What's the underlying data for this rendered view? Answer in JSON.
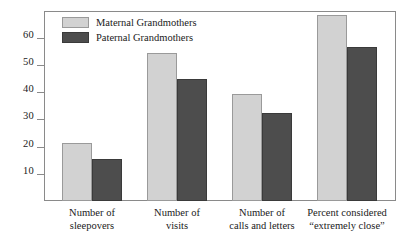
{
  "chart_data": {
    "type": "bar",
    "title": "",
    "subtitle": "",
    "xlabel": "",
    "ylabel": "",
    "grid": false,
    "legend_position": "top-left-inside",
    "ylim": [
      0,
      72
    ],
    "yticks": [
      10,
      20,
      30,
      40,
      50,
      60
    ],
    "ytick_labels": [
      "10",
      "20",
      "30",
      "40",
      "50",
      "60"
    ],
    "categories": [
      "Number of sleepovers",
      "Number of visits",
      "Number of calls and letters",
      "Percent considered \"extremely close\""
    ],
    "category_lines": [
      [
        "Number of",
        "sleepovers"
      ],
      [
        "Number of",
        "visits"
      ],
      [
        "Number of",
        "calls and letters"
      ],
      [
        "Percent considered",
        "“extremely close”"
      ]
    ],
    "series": [
      {
        "name": "Maternal Grandmothers",
        "color": "#d2d2d2",
        "values": [
          21.5,
          54.5,
          39.3,
          68.5
        ]
      },
      {
        "name": "Paternal Grandmothers",
        "color": "#4d4d4d",
        "values": [
          15.6,
          44.8,
          32.4,
          56.5
        ]
      }
    ]
  },
  "legend": {
    "items": [
      {
        "label": "Maternal Grandmothers",
        "swatch": "maternal-swatch"
      },
      {
        "label": "Paternal Grandmothers",
        "swatch": "paternal-swatch"
      }
    ]
  },
  "axis": {
    "y": {
      "ticks": [
        {
          "label": "60"
        },
        {
          "label": "50"
        },
        {
          "label": "40"
        },
        {
          "label": "30"
        },
        {
          "label": "20"
        },
        {
          "label": "10"
        }
      ]
    },
    "x": {
      "categories": [
        {
          "line1": "Number of",
          "line2": "sleepovers"
        },
        {
          "line1": "Number of",
          "line2": "visits"
        },
        {
          "line1": "Number of",
          "line2": "calls and letters"
        },
        {
          "line1": "Percent considered",
          "line2": "“extremely close”"
        }
      ]
    }
  },
  "colors": {
    "maternal": "#d2d2d2",
    "paternal": "#4d4d4d",
    "frame": "#8a8a8a",
    "text": "#1a1a1a",
    "background": "#ffffff"
  }
}
